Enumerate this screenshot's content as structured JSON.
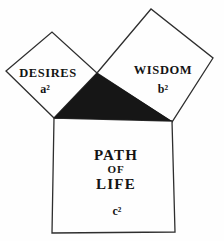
{
  "diagram": {
    "background_color": "#fefefe",
    "line_color": "#2e2e2e",
    "triangle_fill": "#161616",
    "squares": {
      "desires": {
        "label": "DESIRES",
        "symbol": "a²"
      },
      "wisdom": {
        "label": "WISDOM",
        "symbol": "b²"
      },
      "path_of_life": {
        "line1": "PATH",
        "line2": "OF",
        "line3": "LIFE",
        "symbol": "c²"
      }
    }
  }
}
